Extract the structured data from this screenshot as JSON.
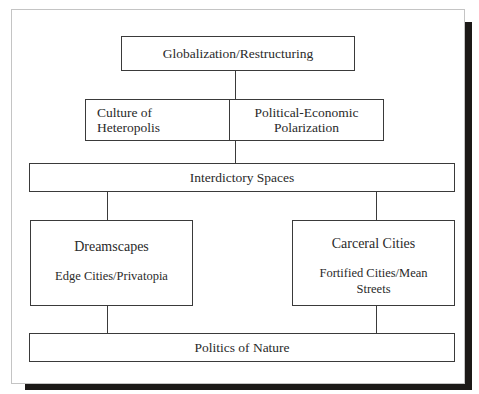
{
  "diagram": {
    "nodes": {
      "top": {
        "label": "Globalization/Restructuring"
      },
      "culture": {
        "line1": "Culture of",
        "line2": "Heteropolis"
      },
      "polarization": {
        "line1": "Political-Economic",
        "line2": "Polarization"
      },
      "interdictory": {
        "label": "Interdictory Spaces"
      },
      "dreamscapes": {
        "title": "Dreamscapes",
        "subtitle": "Edge Cities/Privatopia"
      },
      "carceral": {
        "title": "Carceral Cities",
        "subtitle_line1": "Fortified Cities/Mean",
        "subtitle_line2": "Streets"
      },
      "nature": {
        "label": "Politics of Nature"
      }
    },
    "edges": [
      {
        "from": "Globalization/Restructuring",
        "to": "Culture of Heteropolis / Political-Economic Polarization"
      },
      {
        "from": "Culture of Heteropolis / Political-Economic Polarization",
        "to": "Interdictory Spaces"
      },
      {
        "from": "Interdictory Spaces",
        "to": "Dreamscapes"
      },
      {
        "from": "Interdictory Spaces",
        "to": "Carceral Cities"
      },
      {
        "from": "Dreamscapes",
        "to": "Politics of Nature"
      },
      {
        "from": "Carceral Cities",
        "to": "Politics of Nature"
      }
    ],
    "colors": {
      "line": "#3a3a3a",
      "shadow": "#1c1917",
      "background": "#ffffff"
    }
  }
}
